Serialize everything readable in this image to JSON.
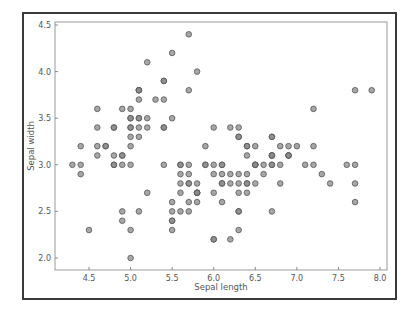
{
  "chart_data": {
    "type": "scatter",
    "title": "",
    "xlabel": "Sepal length",
    "ylabel": "Sepal width",
    "xlim": [
      4.15,
      8.1
    ],
    "ylim": [
      1.87,
      4.54
    ],
    "xticks": [
      "4.5",
      "5.0",
      "5.5",
      "6.0",
      "6.5",
      "7.0",
      "7.5",
      "8.0"
    ],
    "yticks": [
      "2.0",
      "2.5",
      "3.0",
      "3.5",
      "4.0",
      "4.5"
    ],
    "grid": false,
    "legend": null,
    "marker_color": "#8a8a8a",
    "marker_edge": "#555555",
    "x": [
      5.1,
      4.9,
      4.7,
      4.6,
      5.0,
      5.4,
      4.6,
      5.0,
      4.4,
      4.9,
      5.4,
      4.8,
      4.8,
      4.3,
      5.8,
      5.7,
      5.4,
      5.1,
      5.7,
      5.1,
      5.4,
      5.1,
      4.6,
      5.1,
      4.8,
      5.0,
      5.0,
      5.2,
      5.2,
      4.7,
      4.8,
      5.4,
      5.2,
      5.5,
      4.9,
      5.0,
      5.5,
      4.9,
      4.4,
      5.1,
      5.0,
      4.5,
      4.4,
      5.0,
      5.1,
      4.8,
      5.1,
      4.6,
      5.3,
      5.0,
      7.0,
      6.4,
      6.9,
      5.5,
      6.5,
      5.7,
      6.3,
      4.9,
      6.6,
      5.2,
      5.0,
      5.9,
      6.0,
      6.1,
      5.6,
      6.7,
      5.6,
      5.8,
      6.2,
      5.6,
      5.9,
      6.1,
      6.3,
      6.1,
      6.4,
      6.6,
      6.8,
      6.7,
      6.0,
      5.7,
      5.5,
      5.5,
      5.8,
      6.0,
      5.4,
      6.0,
      6.7,
      6.3,
      5.6,
      5.5,
      5.5,
      6.1,
      5.8,
      5.0,
      5.6,
      5.7,
      5.7,
      6.2,
      5.1,
      5.7,
      6.3,
      5.8,
      7.1,
      6.3,
      6.5,
      7.6,
      4.9,
      7.3,
      6.7,
      7.2,
      6.5,
      6.4,
      6.8,
      5.7,
      5.8,
      6.4,
      6.5,
      7.7,
      7.7,
      6.0,
      6.9,
      5.6,
      7.7,
      6.3,
      6.7,
      7.2,
      6.2,
      6.1,
      6.4,
      7.2,
      7.4,
      7.9,
      6.4,
      6.3,
      6.1,
      7.7,
      6.3,
      6.4,
      6.0,
      6.9,
      6.7,
      6.9,
      5.8,
      6.8,
      6.7,
      6.7,
      6.3,
      6.5,
      6.2,
      5.9
    ],
    "y": [
      3.5,
      3.0,
      3.2,
      3.1,
      3.6,
      3.9,
      3.4,
      3.4,
      2.9,
      3.1,
      3.7,
      3.4,
      3.0,
      3.0,
      4.0,
      4.4,
      3.9,
      3.5,
      3.8,
      3.8,
      3.4,
      3.7,
      3.6,
      3.3,
      3.4,
      3.0,
      3.4,
      3.5,
      3.4,
      3.2,
      3.1,
      3.4,
      4.1,
      4.2,
      3.1,
      3.2,
      3.5,
      3.6,
      3.0,
      3.4,
      3.5,
      2.3,
      3.2,
      3.5,
      3.8,
      3.0,
      3.8,
      3.2,
      3.7,
      3.3,
      3.2,
      3.2,
      3.1,
      2.3,
      2.8,
      2.8,
      3.3,
      2.4,
      2.9,
      2.7,
      2.0,
      3.0,
      2.2,
      2.9,
      2.9,
      3.1,
      3.0,
      2.7,
      2.2,
      2.5,
      3.2,
      2.8,
      2.5,
      2.8,
      2.9,
      3.0,
      2.8,
      3.0,
      2.9,
      2.6,
      2.4,
      2.4,
      2.7,
      2.7,
      3.0,
      3.4,
      3.1,
      2.3,
      3.0,
      2.5,
      2.6,
      3.0,
      2.6,
      2.3,
      2.7,
      3.0,
      2.9,
      2.9,
      2.5,
      2.8,
      3.3,
      2.7,
      3.0,
      2.9,
      3.0,
      3.0,
      2.5,
      2.9,
      2.5,
      3.6,
      3.2,
      2.7,
      3.0,
      2.5,
      2.8,
      3.2,
      3.0,
      3.8,
      2.6,
      2.2,
      3.2,
      2.8,
      2.8,
      2.7,
      3.3,
      3.2,
      2.8,
      3.0,
      2.8,
      3.0,
      2.8,
      3.8,
      2.8,
      2.8,
      2.6,
      3.0,
      3.4,
      3.1,
      3.0,
      3.1,
      3.1,
      3.1,
      2.7,
      3.2,
      3.3,
      3.0,
      2.5,
      3.0,
      3.4,
      3.0
    ]
  }
}
